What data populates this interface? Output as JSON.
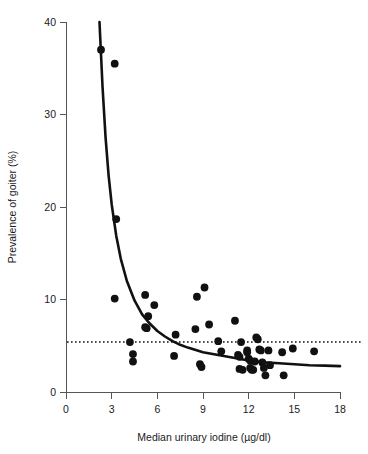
{
  "chart_data": {
    "type": "scatter",
    "title": "",
    "xlabel": "Median urinary iodine (µg/dl)",
    "ylabel": "Prevalence of goiter (%)",
    "xlim": [
      0,
      18
    ],
    "ylim": [
      0,
      40
    ],
    "xticks": [
      0,
      3,
      6,
      9,
      12,
      15,
      18
    ],
    "yticks": [
      0,
      10,
      20,
      30,
      40
    ],
    "xtick_labels": [
      "0",
      "3",
      "6",
      "9",
      "12",
      "15",
      "18"
    ],
    "ytick_labels": [
      "0",
      "10",
      "20",
      "30",
      "40"
    ],
    "grid": false,
    "legend": null,
    "series": [
      {
        "name": "Districts",
        "marker": "filled-circle",
        "color": "#111111",
        "points": [
          [
            2.3,
            37.0
          ],
          [
            3.2,
            35.5
          ],
          [
            3.3,
            18.7
          ],
          [
            3.2,
            10.1
          ],
          [
            4.2,
            5.4
          ],
          [
            4.4,
            4.1
          ],
          [
            4.4,
            3.3
          ],
          [
            5.2,
            10.5
          ],
          [
            5.4,
            8.2
          ],
          [
            5.2,
            7.0
          ],
          [
            5.3,
            6.9
          ],
          [
            5.8,
            9.4
          ],
          [
            7.2,
            6.2
          ],
          [
            7.1,
            3.9
          ],
          [
            8.6,
            10.3
          ],
          [
            8.5,
            6.8
          ],
          [
            8.8,
            3.0
          ],
          [
            8.9,
            2.7
          ],
          [
            9.1,
            11.3
          ],
          [
            9.4,
            7.3
          ],
          [
            10.0,
            5.5
          ],
          [
            10.2,
            4.4
          ],
          [
            11.1,
            7.7
          ],
          [
            11.3,
            4.0
          ],
          [
            11.4,
            3.8
          ],
          [
            11.5,
            5.4
          ],
          [
            11.4,
            2.5
          ],
          [
            11.6,
            2.4
          ],
          [
            11.9,
            4.5
          ],
          [
            11.9,
            4.3
          ],
          [
            12.0,
            3.6
          ],
          [
            12.1,
            3.4
          ],
          [
            12.1,
            2.6
          ],
          [
            12.2,
            2.4
          ],
          [
            12.3,
            2.4
          ],
          [
            12.4,
            3.3
          ],
          [
            12.5,
            5.9
          ],
          [
            12.6,
            5.7
          ],
          [
            12.7,
            4.6
          ],
          [
            12.8,
            4.5
          ],
          [
            12.9,
            3.2
          ],
          [
            13.0,
            2.6
          ],
          [
            13.1,
            1.8
          ],
          [
            13.3,
            4.5
          ],
          [
            13.4,
            2.9
          ],
          [
            14.2,
            4.3
          ],
          [
            14.3,
            1.8
          ],
          [
            14.9,
            4.7
          ],
          [
            16.3,
            4.4
          ]
        ]
      }
    ],
    "fit_curve": {
      "name": "fitted inverse curve",
      "style": "solid",
      "color": "#111111",
      "x_start": 2.2,
      "x_end": 18.0,
      "points": [
        [
          2.2,
          40.0
        ],
        [
          2.4,
          33.0
        ],
        [
          2.6,
          27.5
        ],
        [
          2.8,
          23.4
        ],
        [
          3.0,
          20.3
        ],
        [
          3.3,
          16.9
        ],
        [
          3.6,
          14.4
        ],
        [
          4.0,
          12.0
        ],
        [
          4.5,
          9.9
        ],
        [
          5.0,
          8.4
        ],
        [
          5.5,
          7.4
        ],
        [
          6.0,
          6.6
        ],
        [
          6.5,
          6.0
        ],
        [
          7.0,
          5.5
        ],
        [
          7.5,
          5.1
        ],
        [
          8.0,
          4.8
        ],
        [
          9.0,
          4.3
        ],
        [
          10.0,
          4.0
        ],
        [
          11.0,
          3.7
        ],
        [
          12.0,
          3.4
        ],
        [
          13.0,
          3.2
        ],
        [
          14.0,
          3.1
        ],
        [
          15.0,
          3.0
        ],
        [
          16.0,
          2.9
        ],
        [
          17.0,
          2.85
        ],
        [
          18.0,
          2.8
        ]
      ]
    },
    "reference_line": {
      "name": "national average",
      "orientation": "horizontal",
      "style": "dotted",
      "color": "#111111",
      "y_value": 5.4
    }
  }
}
